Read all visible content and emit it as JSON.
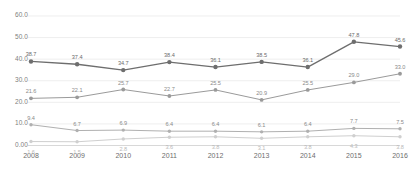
{
  "chart_data": {
    "type": "line",
    "title": "",
    "subtitle": "",
    "xlabel": "",
    "ylabel": "",
    "categories": [
      "2008",
      "2009",
      "2010",
      "2011",
      "2012",
      "2013",
      "2014",
      "2015",
      "2016"
    ],
    "ytick_labels": [
      "60.0",
      "50.0",
      "40.0",
      "30.0",
      "20.0",
      "10.0",
      "0.00"
    ],
    "ytick_values": [
      60,
      50,
      40,
      30,
      20,
      10,
      0
    ],
    "ylim": [
      0,
      63
    ],
    "grid": true,
    "grid_axis": "y",
    "legend": "none",
    "series": [
      {
        "name": "series-1",
        "color": "#6e6e6e",
        "marker": "circle",
        "values": [
          38.7,
          37.4,
          34.7,
          38.4,
          36.1,
          38.5,
          36.1,
          47.8,
          45.6
        ],
        "labels": [
          "38.7",
          "37.4",
          "34.7",
          "38.4",
          "36.1",
          "38.5",
          "36.1",
          "47.8",
          "45.6"
        ]
      },
      {
        "name": "series-2",
        "color": "#9a9a9a",
        "marker": "circle",
        "values": [
          21.6,
          22.1,
          25.7,
          22.7,
          25.5,
          20.9,
          25.5,
          29.0,
          33.0
        ],
        "labels": [
          "21.6",
          "22.1",
          "25.7",
          "22.7",
          "25.5",
          "20.9",
          "25.5",
          "29.0",
          "33.0"
        ]
      },
      {
        "name": "series-3",
        "color": "#b0b0b0",
        "marker": "circle",
        "values": [
          9.4,
          6.7,
          6.9,
          6.4,
          6.4,
          6.1,
          6.4,
          7.7,
          7.5
        ],
        "labels": [
          "9.4",
          "6.7",
          "6.9",
          "6.4",
          "6.4",
          "6.1",
          "6.4",
          "7.7",
          "7.5"
        ]
      },
      {
        "name": "series-4",
        "color": "#cfcfcf",
        "marker": "circle",
        "values": [
          1.6,
          1.5,
          2.8,
          3.6,
          3.8,
          3.1,
          3.8,
          4.3,
          3.8
        ],
        "labels": [
          "1.6",
          "1.5",
          "2.8",
          "3.6",
          "3.8",
          "3.1",
          "3.8",
          "4.3",
          "3.8"
        ]
      }
    ]
  }
}
